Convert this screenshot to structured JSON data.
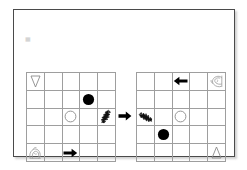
{
  "page": {
    "background_color": "#ffffff",
    "card_border_color": "#4a4a4a",
    "grid_line_color": "#9e9e9e",
    "ink_color": "#000000"
  },
  "corner_mark": {
    "text": "▦",
    "name": "faint-corner-glyph"
  },
  "puzzle": {
    "type": "grid-transformation",
    "transformation_label": "→",
    "rows": 5,
    "columns": 5,
    "relation": "rotate-90-counterclockwise",
    "left_grid": {
      "name": "source-grid",
      "cells": [
        {
          "row": 0,
          "col": 0,
          "icon": "triangle-down-outline"
        },
        {
          "row": 1,
          "col": 3,
          "icon": "circle-filled"
        },
        {
          "row": 2,
          "col": 2,
          "icon": "circle-outline"
        },
        {
          "row": 2,
          "col": 4,
          "icon": "bird-sketch"
        },
        {
          "row": 4,
          "col": 0,
          "icon": "scribble-sketch"
        },
        {
          "row": 4,
          "col": 2,
          "icon": "arrow-right-solid"
        }
      ]
    },
    "right_grid": {
      "name": "target-grid",
      "cells": [
        {
          "row": 0,
          "col": 2,
          "icon": "arrow-left-solid"
        },
        {
          "row": 0,
          "col": 4,
          "icon": "scribble-sketch"
        },
        {
          "row": 2,
          "col": 0,
          "icon": "bird-sketch-rotated"
        },
        {
          "row": 2,
          "col": 2,
          "icon": "circle-outline"
        },
        {
          "row": 3,
          "col": 1,
          "icon": "circle-filled"
        },
        {
          "row": 4,
          "col": 4,
          "icon": "triangle-up-outline"
        }
      ]
    }
  }
}
